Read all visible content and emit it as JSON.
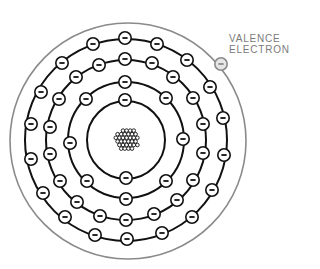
{
  "diagram": {
    "label": {
      "line1": "VALENCE",
      "line2": "ELECTRON"
    },
    "colors": {
      "line": "#111111",
      "valence": "#8a8a8a",
      "valence_fill": "#e6e6e6",
      "label": "#7a7a7a"
    },
    "nucleus": {
      "cx": 127,
      "cy": 140,
      "r": 13
    },
    "outer_boundary": {
      "cx": 128,
      "cy": 141,
      "r": 118
    },
    "shells": [
      {
        "name": "shell-1",
        "r": 39,
        "electrons": [
          [
            125,
            100
          ],
          [
            126,
            178
          ]
        ]
      },
      {
        "name": "shell-2",
        "r": 58,
        "electrons": [
          [
            125,
            82
          ],
          [
            166,
            98
          ],
          [
            183,
            139
          ],
          [
            166,
            181
          ],
          [
            126,
            199
          ],
          [
            87,
            181
          ],
          [
            70,
            143
          ],
          [
            86,
            99
          ]
        ]
      },
      {
        "name": "shell-3",
        "r": 80,
        "electrons": [
          [
            125,
            59
          ],
          [
            152,
            63
          ],
          [
            173,
            77
          ],
          [
            193,
            98
          ],
          [
            203,
            124
          ],
          [
            203,
            153
          ],
          [
            193,
            180
          ],
          [
            177,
            200
          ],
          [
            154,
            214
          ],
          [
            126,
            220
          ],
          [
            100,
            216
          ],
          [
            77,
            202
          ],
          [
            60,
            181
          ],
          [
            50,
            154
          ],
          [
            50,
            127
          ],
          [
            59,
            99
          ],
          [
            76,
            77
          ],
          [
            99,
            65
          ]
        ]
      },
      {
        "name": "shell-4",
        "r": 101,
        "electrons": [
          [
            125,
            38
          ],
          [
            157,
            44
          ],
          [
            187,
            60
          ],
          [
            210,
            87
          ],
          [
            223,
            118
          ],
          [
            224,
            155
          ],
          [
            212,
            190
          ],
          [
            192,
            217
          ],
          [
            162,
            233
          ],
          [
            127,
            239
          ],
          [
            95,
            235
          ],
          [
            65,
            217
          ],
          [
            43,
            193
          ],
          [
            31,
            159
          ],
          [
            31,
            124
          ],
          [
            41,
            92
          ],
          [
            62,
            63
          ],
          [
            93,
            44
          ]
        ]
      }
    ],
    "valence_electron": [
      221,
      64
    ],
    "electron_symbol": "−"
  }
}
